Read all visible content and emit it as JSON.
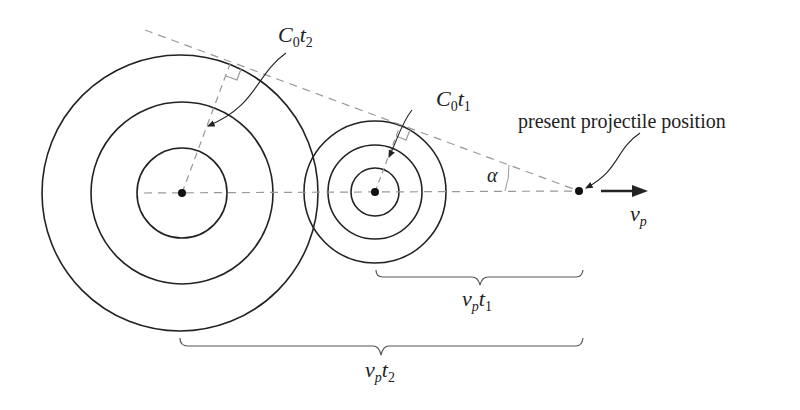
{
  "diagram": {
    "labels": {
      "c0t2": {
        "main": "C",
        "sub1": "0",
        "main2": "t",
        "sub2": "2"
      },
      "c0t1": {
        "main": "C",
        "sub1": "0",
        "main2": "t",
        "sub2": "1"
      },
      "present": "present projectile position",
      "alpha": "α",
      "vp": {
        "main": "v",
        "sub": "p"
      },
      "vpt1": {
        "main": "v",
        "sub1": "p",
        "main2": "t",
        "sub2": "1"
      },
      "vpt2": {
        "main": "v",
        "sub1": "p",
        "main2": "t",
        "sub2": "2"
      }
    },
    "colors": {
      "stroke": "#222222",
      "dashed": "#999999"
    }
  }
}
